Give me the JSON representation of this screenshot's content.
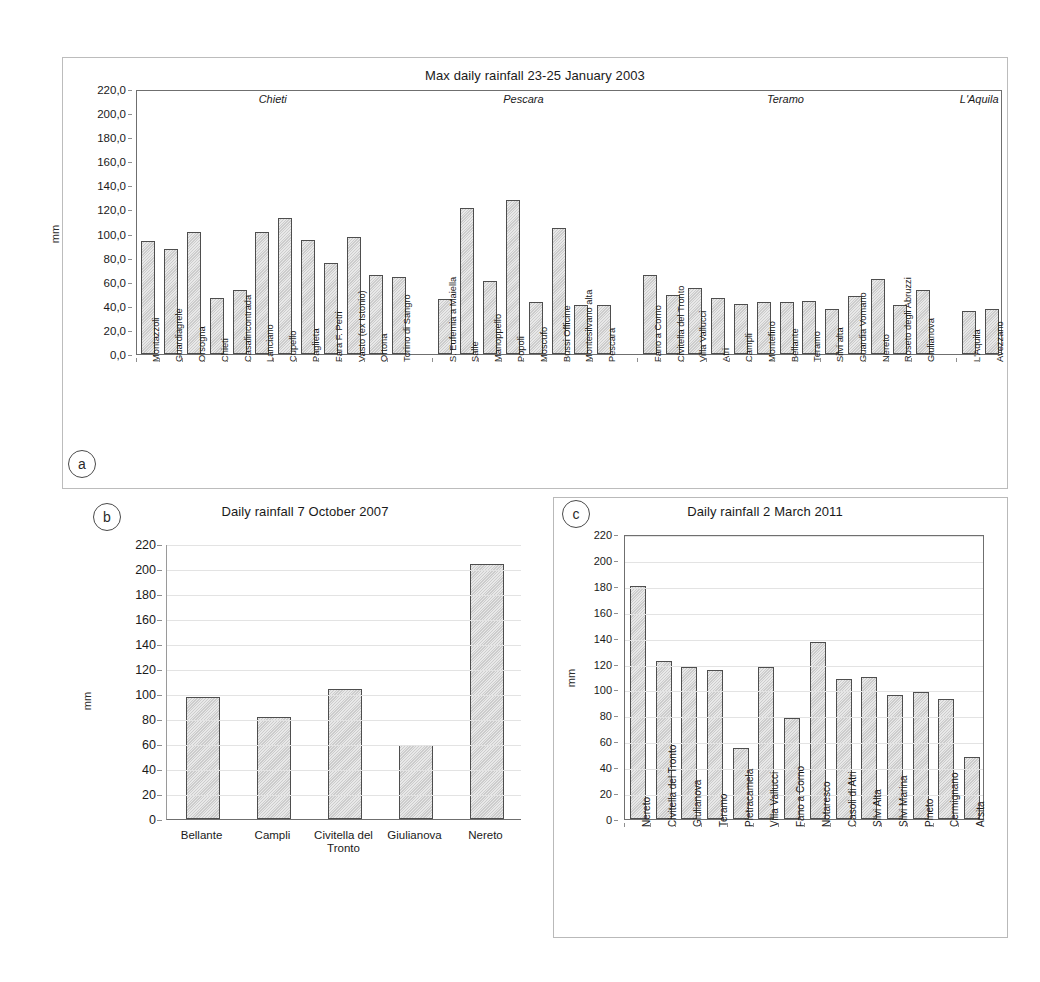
{
  "figure": {
    "panels": [
      "a",
      "b",
      "c"
    ],
    "axis_title": "mm"
  },
  "chart_data": [
    {
      "panel": "a",
      "type": "bar",
      "title": "Max daily rainfall 23-25 January 2003",
      "xlabel": "",
      "ylabel": "mm",
      "ylim": [
        0,
        220
      ],
      "ytick_labels": [
        "0,0",
        "20,0",
        "40,0",
        "60,0",
        "80,0",
        "100,0",
        "120,0",
        "140,0",
        "160,0",
        "180,0",
        "200,0",
        "220,0"
      ],
      "ytick_values": [
        0,
        20,
        40,
        60,
        80,
        100,
        120,
        140,
        160,
        180,
        200,
        220
      ],
      "grid": false,
      "legend": "none",
      "group_labels": [
        "Chieti",
        "Pescara",
        "Teramo",
        "L'Aquila"
      ],
      "groups": [
        {
          "name": "Chieti",
          "categories": [
            "Montazzoli",
            "Guardiagrele",
            "Orsogna",
            "Chieti",
            "Casalincontrada",
            "Lanciano",
            "Cupello",
            "Paglieta",
            "Fara F. Petri",
            "Vasto (ex Istonio)",
            "Ortona",
            "Torino di Sangro"
          ],
          "values": [
            94.0,
            87.0,
            101.5,
            46.5,
            53.5,
            101.0,
            113.0,
            95.0,
            75.5,
            97.0,
            65.5,
            64.0
          ]
        },
        {
          "name": "Pescara",
          "categories": [
            "S. Eufemia a Maiella",
            "Salle",
            "Manoppello",
            "Popoli",
            "Moscufo",
            "Bussi Officine",
            "Montesilvano alta",
            "Pescara"
          ],
          "values": [
            46.0,
            121.0,
            61.0,
            127.5,
            43.0,
            104.5,
            41.0,
            41.0
          ]
        },
        {
          "name": "Teramo",
          "categories": [
            "Fano a Corno",
            "Civitella del Tronto",
            "Villa Vallucci",
            "Atri",
            "Campli",
            "Montefino",
            "Bellante",
            "Teramo",
            "Silvi alta",
            "Guardia Vomano",
            "Nereto",
            "Roseto degli Abruzzi",
            "Giulianova"
          ],
          "values": [
            66.0,
            49.0,
            55.0,
            46.5,
            41.5,
            43.0,
            43.5,
            44.0,
            37.0,
            48.5,
            62.5,
            41.0,
            53.0
          ]
        },
        {
          "name": "L'Aquila",
          "categories": [
            "L'Aquila",
            "Avezzano"
          ],
          "values": [
            36.0,
            37.5
          ]
        }
      ]
    },
    {
      "panel": "b",
      "type": "bar",
      "title": "Daily rainfall 7 October 2007",
      "xlabel": "",
      "ylabel": "mm",
      "ylim": [
        0,
        220
      ],
      "ytick_labels": [
        "0",
        "20",
        "40",
        "60",
        "80",
        "100",
        "120",
        "140",
        "160",
        "180",
        "200",
        "220"
      ],
      "ytick_values": [
        0,
        20,
        40,
        60,
        80,
        100,
        120,
        140,
        160,
        180,
        200,
        220
      ],
      "grid": true,
      "legend": "none",
      "categories": [
        "Bellante",
        "Campli",
        "Civitella del Tronto",
        "Giulianova",
        "Nereto"
      ],
      "values": [
        98.0,
        82.0,
        104.0,
        59.0,
        204.0
      ]
    },
    {
      "panel": "c",
      "type": "bar",
      "title": "Daily rainfall 2 March 2011",
      "xlabel": "",
      "ylabel": "mm",
      "ylim": [
        0,
        220
      ],
      "ytick_labels": [
        "0",
        "20",
        "40",
        "60",
        "80",
        "100",
        "120",
        "140",
        "160",
        "180",
        "200",
        "220"
      ],
      "ytick_values": [
        0,
        20,
        40,
        60,
        80,
        100,
        120,
        140,
        160,
        180,
        200,
        220
      ],
      "grid": true,
      "legend": "none",
      "categories": [
        "Nereto",
        "Civitella del Tronto",
        "Giulianova",
        "Teramo",
        "Pietracamela",
        "Villa Vallucci",
        "Fano a Corno",
        "Notaresco",
        "Casoli di Atri",
        "Silvi Alta",
        "Silvi Marina",
        "Pineto",
        "Cermignano",
        "Arsita"
      ],
      "values": [
        180.0,
        122.0,
        117.0,
        115.0,
        55.0,
        117.0,
        78.0,
        137.0,
        108.0,
        110.0,
        96.0,
        98.0,
        93.0,
        48.0
      ]
    }
  ]
}
